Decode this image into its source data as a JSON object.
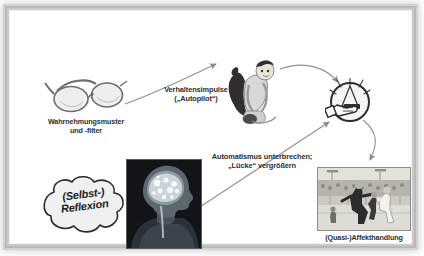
{
  "slide": {
    "background_color": "#ffffff",
    "frame_color": "#bdbdbd",
    "text_color": "#2e2e2e"
  },
  "nodes": {
    "perception": {
      "icon": "eyeglasses-icon",
      "caption": "Wahrnehmungsmuster\nund -filter"
    },
    "impulse_figure": {
      "icon": "cartoon-figure-illustration"
    },
    "trigger": {
      "icon": "hand-detonator-circle-icon"
    },
    "brain": {
      "icon": "brain-head-xray-photo"
    },
    "reflection": {
      "icon": "thought-cloud-icon",
      "label": "(Selbst-)\nReflexion"
    },
    "affect_action": {
      "icon": "brawl-photo",
      "caption": "(Quasi-)Affekthandlung"
    }
  },
  "arrows": {
    "impulse": {
      "label": "Verhaltensimpulse\n(„Autopilot“)",
      "from": "perception",
      "to": "impulse_figure"
    },
    "automatism": {
      "label": "Automatismus unterbrechen;\n„Lücke“ vergrößern",
      "from": "reflection",
      "to": "trigger"
    },
    "figure_to_trigger": {
      "label": "",
      "from": "impulse_figure",
      "to": "trigger"
    },
    "trigger_to_action": {
      "label": "",
      "from": "trigger",
      "to": "affect_action"
    }
  }
}
